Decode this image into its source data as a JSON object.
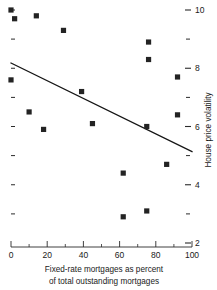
{
  "chart_data": {
    "type": "scatter",
    "title": "",
    "xlabel": "Fixed-rate mortgages as percent of total outstanding mortgages",
    "xlabel_lines": [
      "Fixed-rate mortgages as percent",
      "of total outstanding mortgages"
    ],
    "ylabel": "House price volatility",
    "xlim": [
      0,
      100
    ],
    "ylim": [
      2,
      10
    ],
    "x_ticks": [
      0,
      20,
      40,
      60,
      80,
      100
    ],
    "x_tick_labels": [
      "0",
      "20",
      "40",
      "60",
      "80",
      "100"
    ],
    "x_minor_ticks": [
      10,
      30,
      50,
      70,
      90
    ],
    "y_ticks": [
      2,
      4,
      6,
      8,
      10
    ],
    "y_tick_labels": [
      "2",
      "4",
      "6",
      "8",
      "10"
    ],
    "y_minor_ticks": [
      3,
      5,
      7,
      9
    ],
    "y_axis_position": "right",
    "grid": false,
    "legend": null,
    "marker_style": "filled-square",
    "marker_color": "#232323",
    "points": [
      {
        "x": 0,
        "y": 10.0
      },
      {
        "x": 2,
        "y": 9.7
      },
      {
        "x": 14,
        "y": 9.8
      },
      {
        "x": 29,
        "y": 9.3
      },
      {
        "x": 76,
        "y": 8.9
      },
      {
        "x": 76,
        "y": 8.3
      },
      {
        "x": 0,
        "y": 7.6
      },
      {
        "x": 92,
        "y": 7.7
      },
      {
        "x": 39,
        "y": 7.2
      },
      {
        "x": 10,
        "y": 6.5
      },
      {
        "x": 92,
        "y": 6.4
      },
      {
        "x": 45,
        "y": 6.1
      },
      {
        "x": 75,
        "y": 6.0
      },
      {
        "x": 18,
        "y": 5.9
      },
      {
        "x": 86,
        "y": 4.7
      },
      {
        "x": 62,
        "y": 4.4
      },
      {
        "x": 75,
        "y": 3.1
      },
      {
        "x": 62,
        "y": 2.9
      }
    ],
    "trendline": {
      "type": "linear-fit",
      "color": "#151515",
      "x0": 0,
      "y0": 8.18,
      "x1": 100,
      "y1": 5.14
    }
  }
}
